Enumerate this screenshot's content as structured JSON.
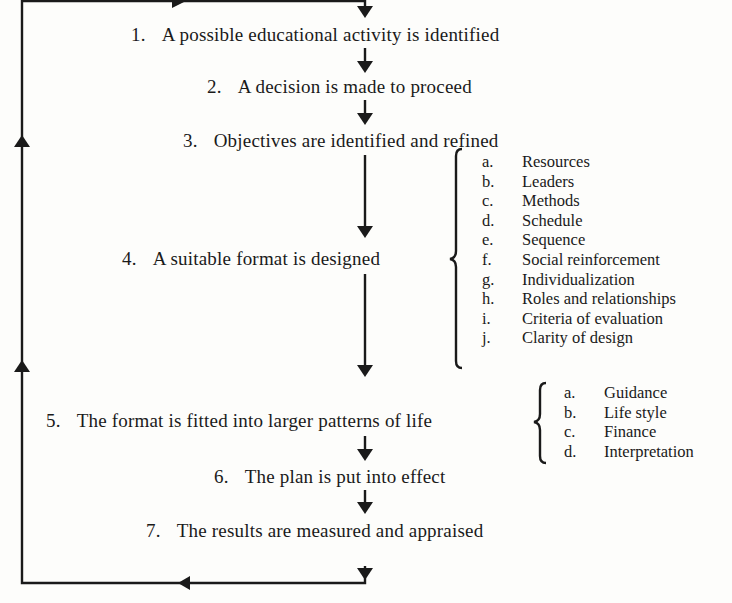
{
  "steps": [
    {
      "num": "1.",
      "text": "A possible educational activity is identified"
    },
    {
      "num": "2.",
      "text": "A decision is made to proceed"
    },
    {
      "num": "3.",
      "text": "Objectives are identified and refined"
    },
    {
      "num": "4.",
      "text": "A suitable format is designed"
    },
    {
      "num": "5.",
      "text": "The format is fitted into larger patterns of life"
    },
    {
      "num": "6.",
      "text": "The plan is put into effect"
    },
    {
      "num": "7.",
      "text": "The results are measured and appraised"
    }
  ],
  "format_components": [
    {
      "key": "a.",
      "label": "Resources"
    },
    {
      "key": "b.",
      "label": "Leaders"
    },
    {
      "key": "c.",
      "label": "Methods"
    },
    {
      "key": "d.",
      "label": "Schedule"
    },
    {
      "key": "e.",
      "label": "Sequence"
    },
    {
      "key": "f.",
      "label": "Social reinforcement"
    },
    {
      "key": "g.",
      "label": "Individualization"
    },
    {
      "key": "h.",
      "label": "Roles and relationships"
    },
    {
      "key": "i.",
      "label": "Criteria of evaluation"
    },
    {
      "key": "j.",
      "label": "Clarity of design"
    }
  ],
  "life_patterns": [
    {
      "key": "a.",
      "label": "Guidance"
    },
    {
      "key": "b.",
      "label": "Life style"
    },
    {
      "key": "c.",
      "label": "Finance"
    },
    {
      "key": "d.",
      "label": "Interpretation"
    }
  ],
  "colors": {
    "ink": "#1a1a1a",
    "paper": "#fdfdfb"
  }
}
